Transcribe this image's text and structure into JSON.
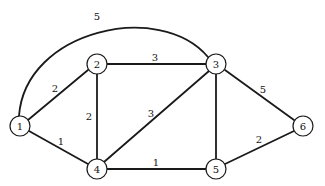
{
  "graph": {
    "type": "weighted-undirected-graph",
    "nodes": [
      {
        "id": "1",
        "label": "1",
        "x": 20,
        "y": 126
      },
      {
        "id": "2",
        "label": "2",
        "x": 97,
        "y": 64
      },
      {
        "id": "3",
        "label": "3",
        "x": 216,
        "y": 64
      },
      {
        "id": "4",
        "label": "4",
        "x": 97,
        "y": 169
      },
      {
        "id": "5",
        "label": "5",
        "x": 216,
        "y": 169
      },
      {
        "id": "6",
        "label": "6",
        "x": 303,
        "y": 126
      }
    ],
    "edges": [
      {
        "from": "1",
        "to": "3",
        "weight": "5",
        "curved": true
      },
      {
        "from": "1",
        "to": "2",
        "weight": "2"
      },
      {
        "from": "1",
        "to": "4",
        "weight": "1"
      },
      {
        "from": "2",
        "to": "3",
        "weight": "3"
      },
      {
        "from": "2",
        "to": "4",
        "weight": "2"
      },
      {
        "from": "4",
        "to": "3",
        "weight": "3"
      },
      {
        "from": "4",
        "to": "5",
        "weight": "1"
      },
      {
        "from": "3",
        "to": "5",
        "weight": ""
      },
      {
        "from": "3",
        "to": "6",
        "weight": "5"
      },
      {
        "from": "5",
        "to": "6",
        "weight": "2"
      }
    ]
  },
  "labels": {
    "node_1": "1",
    "node_2": "2",
    "node_3": "3",
    "node_4": "4",
    "node_5": "5",
    "node_6": "6",
    "edge_1_3": "5",
    "edge_1_2": "2",
    "edge_1_4": "1",
    "edge_2_3": "3",
    "edge_2_4": "2",
    "edge_4_3": "3",
    "edge_4_5": "1",
    "edge_3_6": "5",
    "edge_5_6": "2"
  }
}
